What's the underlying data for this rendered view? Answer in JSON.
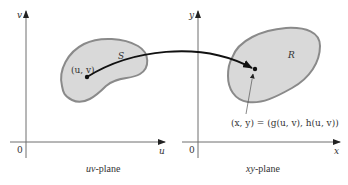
{
  "figure": {
    "left_plane": {
      "caption_var": "uv",
      "caption_rest": "-plane",
      "horizontal_axis_label": "u",
      "vertical_axis_label": "v",
      "origin_label": "0",
      "region_label": "S",
      "point_label": "(u, v)"
    },
    "right_plane": {
      "caption_var": "xy",
      "caption_rest": "-plane",
      "horizontal_axis_label": "x",
      "vertical_axis_label": "y",
      "origin_label": "0",
      "region_label": "R",
      "point_label": "(x, y) = (g(u, v), h(u, v))"
    },
    "colors": {
      "region_fill": "#d9d9d9",
      "region_stroke": "#8a8a8a",
      "axis": "#6e6e6e",
      "arrow": "#111111"
    }
  }
}
